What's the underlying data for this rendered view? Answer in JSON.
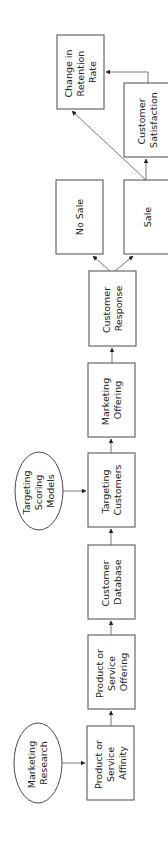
{
  "diagram": {
    "orientation": "rotated-90-ccw",
    "nodes": [
      {
        "id": "change_retention",
        "shape": "rect",
        "lines": [
          "Change in",
          "Retention",
          "Rate"
        ]
      },
      {
        "id": "customer_satisfaction",
        "shape": "rect",
        "lines": [
          "Customer",
          "Satisfaction"
        ]
      },
      {
        "id": "no_sale",
        "shape": "rect",
        "lines": [
          "No Sale"
        ]
      },
      {
        "id": "sale",
        "shape": "rect",
        "lines": [
          "Sale"
        ]
      },
      {
        "id": "customer_response",
        "shape": "rect",
        "lines": [
          "Customer",
          "Response"
        ]
      },
      {
        "id": "marketing_offering",
        "shape": "rect",
        "lines": [
          "Marketing",
          "Offering"
        ]
      },
      {
        "id": "targeting_customers",
        "shape": "rect",
        "lines": [
          "Targeting",
          "Customers"
        ]
      },
      {
        "id": "targeting_scoring_models",
        "shape": "ellipse",
        "lines": [
          "Targeting",
          "Scoring",
          "Models"
        ]
      },
      {
        "id": "customer_database",
        "shape": "rect",
        "lines": [
          "Customer",
          "Database"
        ]
      },
      {
        "id": "product_service_offering",
        "shape": "rect",
        "lines": [
          "Product or",
          "Service",
          "Offering"
        ]
      },
      {
        "id": "product_service_affinity",
        "shape": "rect",
        "lines": [
          "Product or",
          "Service",
          "Affinity"
        ]
      },
      {
        "id": "marketing_research",
        "shape": "ellipse",
        "lines": [
          "Marketing",
          "Research"
        ]
      }
    ],
    "edges": [
      {
        "from": "marketing_research",
        "to": "product_service_affinity"
      },
      {
        "from": "product_service_affinity",
        "to": "product_service_offering"
      },
      {
        "from": "product_service_offering",
        "to": "customer_database"
      },
      {
        "from": "customer_database",
        "to": "targeting_customers"
      },
      {
        "from": "targeting_scoring_models",
        "to": "targeting_customers"
      },
      {
        "from": "targeting_customers",
        "to": "marketing_offering"
      },
      {
        "from": "marketing_offering",
        "to": "customer_response"
      },
      {
        "from": "customer_response",
        "to": "no_sale"
      },
      {
        "from": "customer_response",
        "to": "sale"
      },
      {
        "from": "sale",
        "to": "customer_satisfaction"
      },
      {
        "from": "sale",
        "to": "change_retention"
      },
      {
        "from": "customer_satisfaction",
        "to": "change_retention"
      }
    ]
  },
  "labels": {
    "change_retention": [
      "Change in",
      "Retention",
      "Rate"
    ],
    "customer_satisfaction": [
      "Customer",
      "Satisfaction"
    ],
    "no_sale": [
      "No Sale"
    ],
    "sale": [
      "Sale"
    ],
    "customer_response": [
      "Customer",
      "Response"
    ],
    "marketing_offering": [
      "Marketing",
      "Offering"
    ],
    "targeting_customers": [
      "Targeting",
      "Customers"
    ],
    "targeting_scoring_models": [
      "Targeting",
      "Scoring",
      "Models"
    ],
    "customer_database": [
      "Customer",
      "Database"
    ],
    "product_service_offering": [
      "Product or",
      "Service",
      "Offering"
    ],
    "product_service_affinity": [
      "Product or",
      "Service",
      "Affinity"
    ],
    "marketing_research": [
      "Marketing",
      "Research"
    ]
  }
}
